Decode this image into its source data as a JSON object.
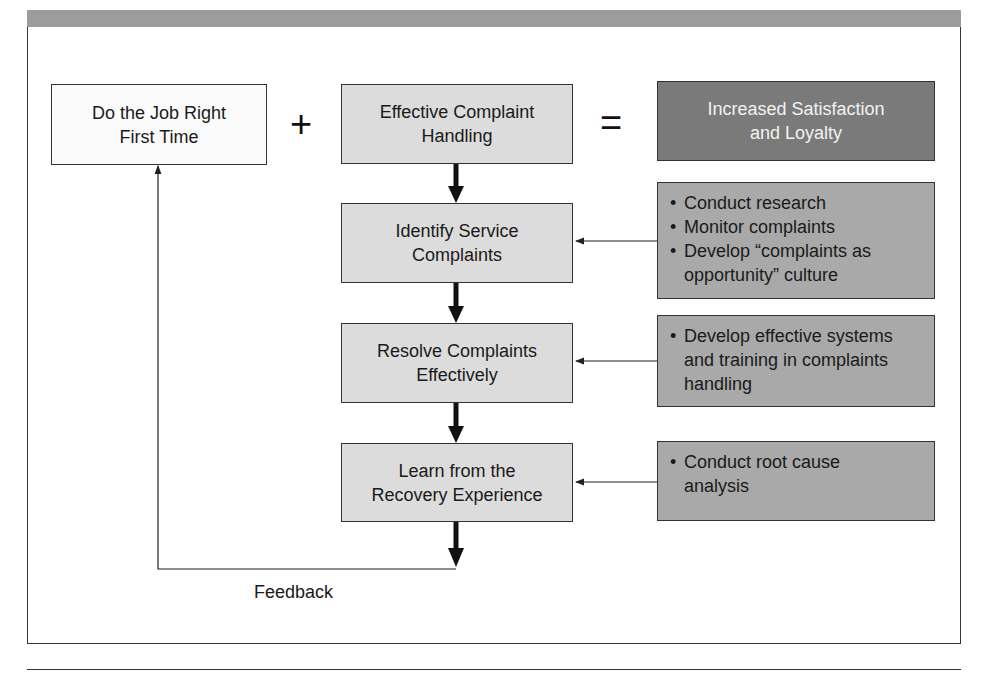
{
  "diagram": {
    "equation": {
      "left": "Do the Job Right First Time",
      "left_lines": [
        "Do the Job Right",
        "First Time"
      ],
      "plus": "+",
      "middle_lines": [
        "Effective Complaint",
        "Handling"
      ],
      "equals": "=",
      "result_lines": [
        "Increased Satisfaction",
        "and Loyalty"
      ]
    },
    "steps": [
      {
        "lines": [
          "Identify Service",
          "Complaints"
        ]
      },
      {
        "lines": [
          "Resolve Complaints",
          "Effectively"
        ]
      },
      {
        "lines": [
          "Learn from the",
          "Recovery Experience"
        ]
      }
    ],
    "actions": [
      {
        "bullets": [
          "Conduct research",
          "Monitor complaints",
          "Develop “complaints as opportunity” culture"
        ]
      },
      {
        "bullets": [
          "Develop effective systems and training in complaints handling"
        ]
      },
      {
        "bullets": [
          "Conduct root cause analysis"
        ]
      }
    ],
    "feedback_label": "Feedback",
    "colors": {
      "header_bar": "#9c9c9c",
      "white_box": "#fbfbfb",
      "light_box": "#dcdcdc",
      "result_box": "#7a7a7a",
      "action_box": "#a9a9a9"
    }
  }
}
